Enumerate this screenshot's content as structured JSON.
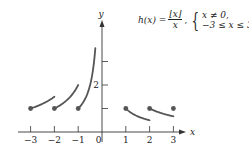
{
  "formula": {
    "lhs": "h(x) =",
    "numerator": "⌊x⌋",
    "denominator": "x",
    "separator": ",",
    "conditions": [
      "x ≠ 0,",
      "−3 ≤ x ≤ 3"
    ]
  },
  "axes": {
    "x_label": "x",
    "y_label": "y",
    "x_ticks": [
      "−3",
      "−2",
      "−1",
      "0",
      "1",
      "2",
      "3"
    ],
    "y_tick_labels": {
      "2": "2"
    }
  },
  "colors": {
    "curve": "#555555",
    "axis": "#333333"
  },
  "chart_data": {
    "type": "line",
    "xlabel": "x",
    "ylabel": "y",
    "xlim": [
      -3.3,
      3.5
    ],
    "ylim": [
      0,
      4
    ],
    "x_ticks": [
      -3,
      -2,
      -1,
      0,
      1,
      2,
      3
    ],
    "y_ticks": [
      1,
      2,
      3
    ],
    "y_tick_labels_shown": [
      2
    ],
    "grid": false,
    "series": [
      {
        "name": "segment [-3,-2)",
        "x": [
          -3,
          -2
        ],
        "y": [
          1,
          1.5
        ],
        "closed_start": true,
        "open_end": true
      },
      {
        "name": "segment [-2,-1)",
        "x": [
          -2,
          -1
        ],
        "y": [
          1,
          2
        ],
        "closed_start": true,
        "open_end": true
      },
      {
        "name": "segment [-1,0)",
        "x": [
          -1,
          -0.28
        ],
        "y": [
          1,
          3.6
        ],
        "closed_start": true,
        "asymptote_at": 0
      },
      {
        "name": "segment [1,2)",
        "x": [
          1,
          2
        ],
        "y": [
          1,
          0.5
        ],
        "closed_start": true,
        "open_end": true
      },
      {
        "name": "segment [2,3)",
        "x": [
          2,
          3
        ],
        "y": [
          1,
          0.667
        ],
        "closed_start": true,
        "open_end": true
      },
      {
        "name": "point x=3",
        "x": [
          3
        ],
        "y": [
          1
        ],
        "closed_start": true
      }
    ]
  }
}
